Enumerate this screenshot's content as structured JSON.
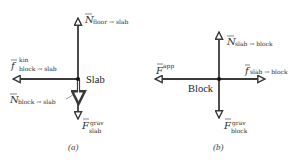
{
  "diagram_a": {
    "caption": "(a)",
    "object_label": "Slab",
    "forces": {
      "normal_floor": {
        "symbol": "N",
        "superscript": "",
        "subscript": "floor → slab"
      },
      "friction_kin": {
        "symbol": "f",
        "superscript": "kin",
        "subscript": "block → slab"
      },
      "normal_block": {
        "symbol": "N",
        "superscript": "",
        "subscript": "block → slab"
      },
      "gravity": {
        "symbol": "F",
        "superscript": "grav",
        "subscript": "slab"
      }
    }
  },
  "diagram_b": {
    "caption": "(b)",
    "object_label": "Block",
    "forces": {
      "normal_slab": {
        "symbol": "N",
        "superscript": "",
        "subscript": "slab → block"
      },
      "applied": {
        "symbol": "F",
        "superscript": "app",
        "subscript": ""
      },
      "friction": {
        "symbol": "f",
        "superscript": "",
        "subscript": "slab → block"
      },
      "gravity": {
        "symbol": "F",
        "superscript": "grav",
        "subscript": "block"
      }
    }
  },
  "colors": {
    "arrow_stroke": "#3a3a3a",
    "arrow_head_fill": "#ffffff",
    "label_text": "#333333"
  }
}
